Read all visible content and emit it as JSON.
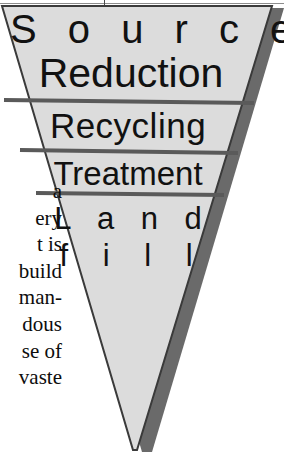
{
  "figure": {
    "name": "waste-management-hierarchy-inverted-triangle",
    "shape": "inverted-triangle",
    "fill_color": "#dcdcdc",
    "shadow_color": "#6a6a6a",
    "outline_color": "#3a3a3a",
    "divider_color": "#5a5a5a",
    "background_color": "#ffffff",
    "text_color": "#111111"
  },
  "tiers": [
    {
      "id": "tier-1",
      "label_line_1": "S o u r c e",
      "label_line_2": "Reduction",
      "rank": 1
    },
    {
      "id": "tier-2",
      "label_line_1": "Recycling",
      "rank": 2
    },
    {
      "id": "tier-3",
      "label_line_1": "Treatment",
      "rank": 3
    },
    {
      "id": "tier-4",
      "label_line_1": "L a n d",
      "label_line_2": "f i l l",
      "rank": 4
    }
  ],
  "labels": {
    "source": "S o u r c e",
    "reduction": "Reduction",
    "recycling": "Recycling",
    "treatment": "Treatment",
    "land": "L a n d",
    "fill": "f i l l"
  },
  "bodycopy": {
    "lines": [
      "a",
      "ery",
      "t is",
      "build",
      "man-",
      "dous",
      "se of",
      "vaste"
    ]
  }
}
